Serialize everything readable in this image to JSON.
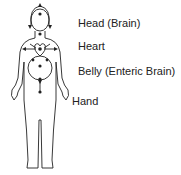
{
  "diagram": {
    "type": "body-centers",
    "labels": [
      {
        "id": "head",
        "text": "Head (Brain)"
      },
      {
        "id": "heart",
        "text": "Heart"
      },
      {
        "id": "belly",
        "text": "Belly (Enteric Brain)"
      },
      {
        "id": "hand",
        "text": "Hand"
      }
    ],
    "colors": {
      "line": "#222222",
      "text": "#222222",
      "background": "#ffffff"
    }
  }
}
